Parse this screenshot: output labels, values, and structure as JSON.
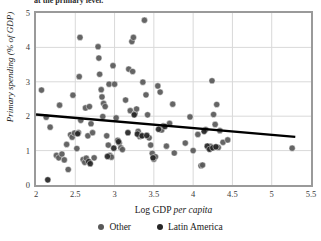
{
  "title": "at the primary level.",
  "axes": {
    "xlabel_plain": "Log GDP ",
    "xlabel_italic": "per capita",
    "ylabel": "Primary spending (% of GDP)",
    "xticks": [
      "2",
      "2.5",
      "3",
      "3.5",
      "4",
      "4.5",
      "5",
      "5.5"
    ],
    "yticks": [
      "5",
      "4",
      "3",
      "2",
      "1",
      "0"
    ]
  },
  "legend": {
    "items": [
      {
        "label": "Other",
        "color": "#595959"
      },
      {
        "label": "Latin America",
        "color": "#262626"
      }
    ]
  },
  "colors": {
    "other": "#595959",
    "latin_america": "#262626",
    "gridline": "#d9d9d9",
    "border": "#9a9a9a",
    "trendline": "#000000",
    "plot_background": "#ffffff"
  },
  "chart_data": {
    "type": "scatter",
    "title": "at the primary level.",
    "xlabel": "Log GDP per capita",
    "ylabel": "Primary spending (% of GDP)",
    "xlim": [
      2,
      5.5
    ],
    "ylim": [
      0,
      5
    ],
    "xticks": [
      2,
      2.5,
      3,
      3.5,
      4,
      4.5,
      5,
      5.5
    ],
    "yticks": [
      0,
      1,
      2,
      3,
      4,
      5
    ],
    "grid": true,
    "legend_position": "bottom",
    "trendline": {
      "label": "linear fit",
      "x": [
        2.0,
        5.3
      ],
      "y": [
        2.05,
        1.4
      ],
      "color": "#000000",
      "width": 2.4
    },
    "series": [
      {
        "name": "Other",
        "color": "#595959",
        "marker": "circle",
        "points": [
          [
            2.07,
            2.76
          ],
          [
            2.13,
            1.97
          ],
          [
            2.18,
            1.68
          ],
          [
            2.3,
            2.32
          ],
          [
            2.26,
            0.86
          ],
          [
            2.29,
            0.79
          ],
          [
            2.33,
            0.9
          ],
          [
            2.36,
            0.73
          ],
          [
            2.39,
            1.18
          ],
          [
            2.41,
            0.45
          ],
          [
            2.44,
            1.46
          ],
          [
            2.46,
            1.39
          ],
          [
            2.49,
            1.51
          ],
          [
            2.47,
            2.61
          ],
          [
            2.52,
            1.06
          ],
          [
            2.54,
            1.52
          ],
          [
            2.56,
            4.29
          ],
          [
            2.55,
            3.15
          ],
          [
            2.57,
            1.88
          ],
          [
            2.6,
            0.74
          ],
          [
            2.62,
            0.66
          ],
          [
            2.64,
            0.78
          ],
          [
            2.66,
            1.43
          ],
          [
            2.63,
            2.24
          ],
          [
            2.68,
            2.28
          ],
          [
            2.7,
            1.78
          ],
          [
            2.72,
            1.52
          ],
          [
            2.74,
            0.79
          ],
          [
            2.79,
            4.02
          ],
          [
            2.8,
            3.69
          ],
          [
            2.81,
            3.22
          ],
          [
            2.83,
            2.77
          ],
          [
            2.84,
            2.56
          ],
          [
            2.86,
            2.37
          ],
          [
            2.88,
            2.28
          ],
          [
            2.85,
            1.99
          ],
          [
            2.9,
            1.43
          ],
          [
            2.92,
            1.16
          ],
          [
            2.94,
            0.86
          ],
          [
            2.96,
            0.81
          ],
          [
            2.93,
            2.93
          ],
          [
            2.98,
            3.47
          ],
          [
            3.0,
            2.93
          ],
          [
            3.02,
            1.95
          ],
          [
            3.04,
            1.3
          ],
          [
            3.06,
            1.22
          ],
          [
            3.08,
            1.08
          ],
          [
            3.1,
            1.03
          ],
          [
            3.14,
            2.47
          ],
          [
            3.18,
            3.37
          ],
          [
            3.2,
            2.16
          ],
          [
            3.22,
            4.17
          ],
          [
            3.24,
            4.29
          ],
          [
            3.23,
            3.3
          ],
          [
            3.26,
            2.08
          ],
          [
            3.28,
            2.21
          ],
          [
            3.3,
            1.56
          ],
          [
            3.32,
            1.41
          ],
          [
            3.34,
            1.44
          ],
          [
            3.36,
            2.99
          ],
          [
            3.38,
            4.79
          ],
          [
            3.4,
            2.62
          ],
          [
            3.42,
            2.04
          ],
          [
            3.44,
            1.37
          ],
          [
            3.46,
            1.16
          ],
          [
            3.48,
            0.92
          ],
          [
            3.5,
            0.75
          ],
          [
            3.52,
            0.82
          ],
          [
            3.55,
            2.88
          ],
          [
            3.58,
            2.7
          ],
          [
            3.6,
            1.6
          ],
          [
            3.62,
            1.72
          ],
          [
            3.66,
            1.13
          ],
          [
            3.7,
            1.79
          ],
          [
            3.74,
            2.35
          ],
          [
            3.76,
            0.93
          ],
          [
            3.9,
            1.22
          ],
          [
            3.96,
            1.98
          ],
          [
            4.0,
            1.0
          ],
          [
            4.06,
            1.47
          ],
          [
            4.1,
            0.56
          ],
          [
            4.12,
            0.58
          ],
          [
            4.16,
            1.61
          ],
          [
            4.2,
            1.06
          ],
          [
            4.22,
            1.12
          ],
          [
            4.24,
            3.03
          ],
          [
            4.26,
            2.05
          ],
          [
            4.28,
            1.76
          ],
          [
            4.3,
            2.34
          ],
          [
            4.32,
            1.09
          ],
          [
            4.34,
            1.58
          ],
          [
            4.38,
            1.24
          ],
          [
            4.44,
            1.31
          ],
          [
            5.26,
            1.07
          ]
        ]
      },
      {
        "name": "Latin America",
        "color": "#262626",
        "marker": "circle",
        "points": [
          [
            2.15,
            0.15
          ],
          [
            2.53,
            1.49
          ],
          [
            2.67,
            0.68
          ],
          [
            2.69,
            0.62
          ],
          [
            2.91,
            0.83
          ],
          [
            2.99,
            1.07
          ],
          [
            3.05,
            1.26
          ],
          [
            3.17,
            1.52
          ],
          [
            3.25,
            2.04
          ],
          [
            3.29,
            1.48
          ],
          [
            3.35,
            1.43
          ],
          [
            3.41,
            1.44
          ],
          [
            3.49,
            0.79
          ],
          [
            3.56,
            1.62
          ],
          [
            3.64,
            1.7
          ],
          [
            4.18,
            1.13
          ],
          [
            4.21,
            1.04
          ],
          [
            4.25,
            1.08
          ],
          [
            4.29,
            1.11
          ],
          [
            4.14,
            1.56
          ]
        ]
      }
    ]
  }
}
